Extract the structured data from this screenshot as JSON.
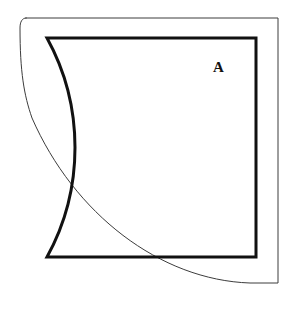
{
  "figure": {
    "background_color": "#ffffff",
    "width": 288,
    "height": 315,
    "labels": [
      {
        "id": "A",
        "text": "A",
        "x": 219,
        "y": 68,
        "color": "#111111",
        "font_size": 15,
        "font_style": "serif-bold"
      }
    ],
    "shapes": {
      "outer_outline": {
        "name": "outer-rounded-outline",
        "stroke_color": "#3c3c3c",
        "stroke_width": 1,
        "fill": "none",
        "description": "thin outline: top edge, right edge, bottom edge, and a long arc sweeping from top-left down to bottom-right",
        "top_edge_y": 18,
        "top_edge_x_start": 20,
        "top_edge_x_end": 278,
        "right_edge_x": 278,
        "bottom_edge_y": 283,
        "arc_start_x": 20,
        "arc_start_y": 18,
        "arc_end_x": 256,
        "arc_end_y": 283,
        "path": "M 26 18 L 278 18 L 278 283 L 250 283 C 160 280 74 214 32 118 C 24 95 20 72 20 28 C 20 22 22 18 26 18 Z"
      },
      "inner_quarter_disc": {
        "name": "inner-quarter-disc",
        "stroke_color": "#111111",
        "stroke_width": 3,
        "fill": "none",
        "description": "thick quarter-circle: horizontal top edge, vertical right edge, and a concave arc from bottom-right corner back to top-left corner",
        "corner_x": 256,
        "corner_y": 257,
        "top_left_x": 47,
        "top_left_y": 38,
        "top_right_x": 256,
        "top_right_y": 38,
        "radius_x": 209,
        "radius_y": 219,
        "path": "M 47 38 L 256 38 L 256 257 L 47 257 A 209 219 0 0 0 47 38 Z"
      }
    }
  }
}
